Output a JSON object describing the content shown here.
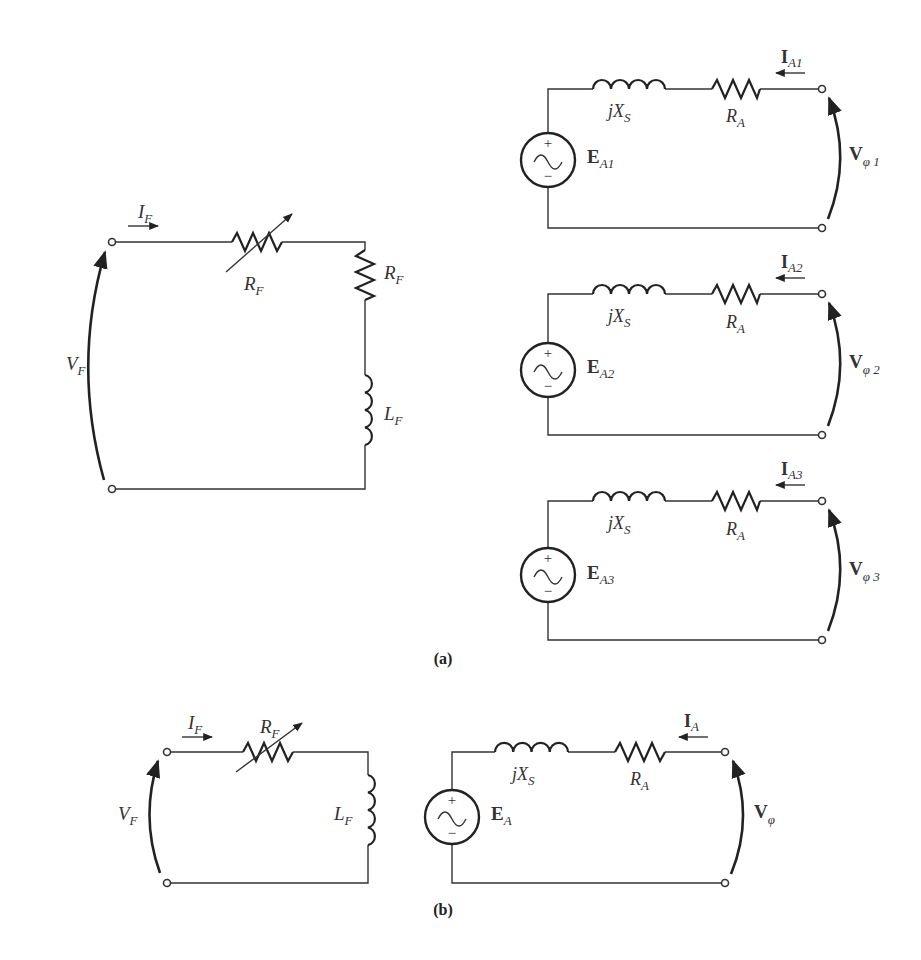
{
  "figure": {
    "panels": [
      {
        "id": "a",
        "caption": "(a)",
        "field_circuit": {
          "current_label": {
            "main": "I",
            "sub": "F"
          },
          "voltage_label": {
            "main": "V",
            "sub": "F"
          },
          "variable_resistor_label": {
            "main": "R",
            "sub": "F"
          },
          "fixed_resistor_label": {
            "main": "R",
            "sub": "F"
          },
          "inductor_label": {
            "main": "L",
            "sub": "F"
          }
        },
        "armature_circuits": [
          {
            "reactance_label": {
              "main": "jX",
              "sub": "S"
            },
            "resistance_label": {
              "main": "R",
              "sub": "A"
            },
            "source_label": {
              "main": "E",
              "sub": "A1"
            },
            "current_label": {
              "main": "I",
              "sub": "A1"
            },
            "voltage_label": {
              "main": "V",
              "sub": "φ 1"
            },
            "source_plus": "+",
            "source_minus": "−"
          },
          {
            "reactance_label": {
              "main": "jX",
              "sub": "S"
            },
            "resistance_label": {
              "main": "R",
              "sub": "A"
            },
            "source_label": {
              "main": "E",
              "sub": "A2"
            },
            "current_label": {
              "main": "I",
              "sub": "A2"
            },
            "voltage_label": {
              "main": "V",
              "sub": "φ 2"
            },
            "source_plus": "+",
            "source_minus": "−"
          },
          {
            "reactance_label": {
              "main": "jX",
              "sub": "S"
            },
            "resistance_label": {
              "main": "R",
              "sub": "A"
            },
            "source_label": {
              "main": "E",
              "sub": "A3"
            },
            "current_label": {
              "main": "I",
              "sub": "A3"
            },
            "voltage_label": {
              "main": "V",
              "sub": "φ 3"
            },
            "source_plus": "+",
            "source_minus": "−"
          }
        ]
      },
      {
        "id": "b",
        "caption": "(b)",
        "field_circuit": {
          "current_label": {
            "main": "I",
            "sub": "F"
          },
          "voltage_label": {
            "main": "V",
            "sub": "F"
          },
          "variable_resistor_label": {
            "main": "R",
            "sub": "F"
          },
          "inductor_label": {
            "main": "L",
            "sub": "F"
          }
        },
        "armature_circuit": {
          "reactance_label": {
            "main": "jX",
            "sub": "S"
          },
          "resistance_label": {
            "main": "R",
            "sub": "A"
          },
          "source_label": {
            "main": "E",
            "sub": "A"
          },
          "current_label": {
            "main": "I",
            "sub": "A"
          },
          "voltage_label": {
            "main": "V",
            "sub": "φ"
          },
          "source_plus": "+",
          "source_minus": "−"
        }
      }
    ]
  },
  "colors": {
    "line": "#333333",
    "text": "#333333",
    "background": "#ffffff"
  }
}
